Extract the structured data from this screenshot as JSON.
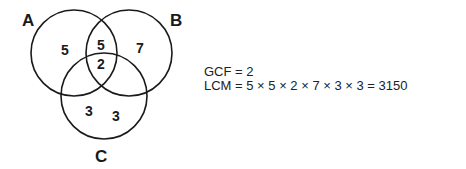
{
  "venn": {
    "sets": [
      {
        "label": "A",
        "cx": 74,
        "cy": 53,
        "r": 43
      },
      {
        "label": "B",
        "cx": 129,
        "cy": 53,
        "r": 43
      },
      {
        "label": "C",
        "cx": 104,
        "cy": 95,
        "r": 43
      }
    ],
    "regions": {
      "a_only": "5",
      "ab_only": "5",
      "abc": "2",
      "b_only": "7",
      "c_only_1": "3",
      "c_only_2": "3"
    }
  },
  "equations": {
    "gcf": "GCF = 2",
    "lcm": "LCM = 5 × 5 × 2 × 7 × 3 × 3 = 3150"
  },
  "colors": {
    "stroke": "#1a1a1a",
    "text": "#1a1a1a"
  }
}
